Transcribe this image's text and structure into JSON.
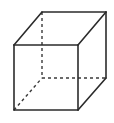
{
  "figure": {
    "name": "cube",
    "caption": "",
    "width": 114,
    "height": 123,
    "background_color": "#ffffff",
    "stroke_color": "#2b2b2b",
    "hidden_stroke_color": "#3a3a3a",
    "solid_stroke_width": 1.6,
    "hidden_stroke_width": 1.4,
    "hidden_dash_pattern": "3,3"
  },
  "geometry": {
    "type": "wireframe-cube",
    "projection": "oblique",
    "vertices": {
      "front_top_left": [
        14,
        45
      ],
      "front_top_right": [
        78,
        45
      ],
      "front_bottom_right": [
        78,
        110
      ],
      "front_bottom_left": [
        14,
        110
      ],
      "back_top_left": [
        42,
        12
      ],
      "back_top_right": [
        106,
        12
      ],
      "back_bottom_right": [
        106,
        78
      ],
      "back_bottom_left": [
        42,
        78
      ]
    },
    "visible_edges": [
      {
        "name": "front-top",
        "from": "front_top_left",
        "to": "front_top_right",
        "points": "14,45 78,45"
      },
      {
        "name": "front-right",
        "from": "front_top_right",
        "to": "front_bottom_right",
        "points": "78,45 78,110"
      },
      {
        "name": "front-bottom",
        "from": "front_bottom_right",
        "to": "front_bottom_left",
        "points": "78,110 14,110"
      },
      {
        "name": "front-left",
        "from": "front_bottom_left",
        "to": "front_top_left",
        "points": "14,110 14,45"
      },
      {
        "name": "back-top",
        "from": "back_top_left",
        "to": "back_top_right",
        "points": "42,12 106,12"
      },
      {
        "name": "back-right",
        "from": "back_top_right",
        "to": "back_bottom_right",
        "points": "106,12 106,78"
      },
      {
        "name": "connector-top-left",
        "from": "front_top_left",
        "to": "back_top_left",
        "points": "14,45 42,12"
      },
      {
        "name": "connector-top-right",
        "from": "front_top_right",
        "to": "back_top_right",
        "points": "78,45 106,12"
      },
      {
        "name": "connector-bottom-right",
        "from": "front_bottom_right",
        "to": "back_bottom_right",
        "points": "78,110 106,78"
      }
    ],
    "hidden_edges": [
      {
        "name": "back-left-vertical",
        "from": "back_top_left",
        "to": "back_bottom_left",
        "points": "42,12 42,78"
      },
      {
        "name": "back-bottom",
        "from": "back_bottom_left",
        "to": "back_bottom_right",
        "points": "42,78 106,78"
      },
      {
        "name": "connector-bottom-left",
        "from": "front_bottom_left",
        "to": "back_bottom_left",
        "points": "14,110 42,78"
      }
    ]
  }
}
